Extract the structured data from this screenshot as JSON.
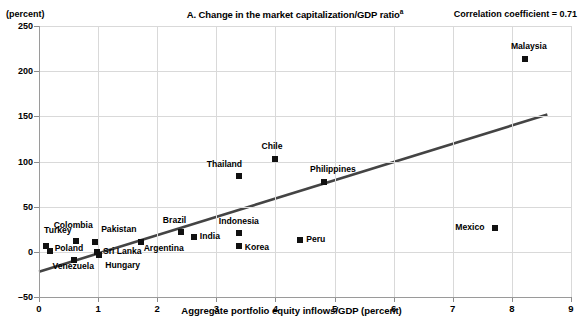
{
  "header": {
    "title_text": "A. Change in the market capitalization/GDP ratio",
    "title_superscript": "a",
    "correlation_label": "Correlation coefficient = 0.71",
    "unit_label": "(percent)"
  },
  "chart_data": {
    "type": "scatter",
    "title": "A. Change in the market capitalization/GDP ratio",
    "xlabel": "Aggregate portfolio equity inflows/GDP (percent)",
    "ylabel": "(percent)",
    "xlim": [
      0,
      9
    ],
    "ylim": [
      -50,
      250
    ],
    "xticks": [
      "0",
      "1",
      "2",
      "3",
      "4",
      "5",
      "6",
      "7",
      "8",
      "9"
    ],
    "yticks": [
      "250",
      "200",
      "150",
      "100",
      "50",
      "0",
      "-50"
    ],
    "grid": true,
    "legend": "none",
    "correlation_coefficient": 0.71,
    "trendline": {
      "x0": 0.0,
      "y0": -22,
      "x1": 8.6,
      "y1": 152
    },
    "points": [
      {
        "label": "Turkey",
        "x": 0.12,
        "y": 6,
        "label_dx": -2,
        "label_dy": -16
      },
      {
        "label": "Poland",
        "x": 0.18,
        "y": 1,
        "label_dx": 5,
        "label_dy": -3
      },
      {
        "label": "Colombia",
        "x": 0.62,
        "y": 12,
        "label_dx": -22,
        "label_dy": -16
      },
      {
        "label": "Venezuela",
        "x": 0.6,
        "y": -9,
        "label_dx": -22,
        "label_dy": 6
      },
      {
        "label": "Pakistan",
        "x": 0.95,
        "y": 11,
        "label_dx": 6,
        "label_dy": -13
      },
      {
        "label": "Sri Lanka",
        "x": 0.98,
        "y": 0,
        "label_dx": 6,
        "label_dy": -1
      },
      {
        "label": "Hungary",
        "x": 1.02,
        "y": -3,
        "label_dx": 6,
        "label_dy": 10
      },
      {
        "label": "Argentina",
        "x": 1.72,
        "y": 11,
        "label_dx": 3,
        "label_dy": 6
      },
      {
        "label": "Brazil",
        "x": 2.4,
        "y": 22,
        "label_dx": -18,
        "label_dy": -12
      },
      {
        "label": "India",
        "x": 2.62,
        "y": 16,
        "label_dx": 6,
        "label_dy": -1
      },
      {
        "label": "Thailand",
        "x": 3.38,
        "y": 84,
        "label_dx": -32,
        "label_dy": -12
      },
      {
        "label": "Indonesia",
        "x": 3.38,
        "y": 21,
        "label_dx": -20,
        "label_dy": -12
      },
      {
        "label": "Korea",
        "x": 3.38,
        "y": 7,
        "label_dx": 6,
        "label_dy": 1
      },
      {
        "label": "Chile",
        "x": 4.0,
        "y": 103,
        "label_dx": -14,
        "label_dy": -13
      },
      {
        "label": "Peru",
        "x": 4.42,
        "y": 13,
        "label_dx": 6,
        "label_dy": -1
      },
      {
        "label": "Philippines",
        "x": 4.82,
        "y": 77,
        "label_dx": -14,
        "label_dy": -13
      },
      {
        "label": "Mexico",
        "x": 7.72,
        "y": 26,
        "label_dx": -40,
        "label_dy": -1
      },
      {
        "label": "Malaysia",
        "x": 8.22,
        "y": 213,
        "label_dx": -14,
        "label_dy": -13
      }
    ]
  },
  "axis": {
    "x_title": "Aggregate portfolio equity inflows/GDP (percent)"
  }
}
